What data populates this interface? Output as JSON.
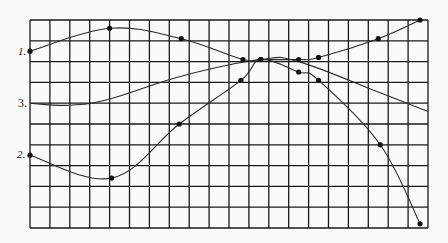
{
  "chart_data": {
    "type": "line",
    "title": "",
    "xlabel": "",
    "ylabel": "",
    "grid": true,
    "xlim": [
      0,
      20
    ],
    "ylim": [
      0,
      10
    ],
    "grid_columns": 20,
    "grid_rows": 10,
    "legend_position": "left-inline",
    "colors": {
      "line": "#2a2a2a",
      "grid": "#1a1a1a",
      "background": "#fafafa"
    },
    "series": [
      {
        "name": "1.",
        "label": "1.",
        "points": [
          [
            0,
            8.5
          ],
          [
            4.0,
            9.6
          ],
          [
            7.6,
            9.1
          ],
          [
            10.7,
            8.1
          ],
          [
            11.6,
            8.1
          ],
          [
            13.5,
            8.1
          ],
          [
            14.5,
            8.2
          ],
          [
            17.5,
            9.1
          ],
          [
            19.6,
            10.0
          ]
        ],
        "markers": [
          [
            0,
            8.5
          ],
          [
            4.0,
            9.6
          ],
          [
            7.6,
            9.1
          ],
          [
            10.7,
            8.1
          ],
          [
            11.6,
            8.1
          ],
          [
            13.5,
            8.1
          ],
          [
            14.5,
            8.2
          ],
          [
            17.5,
            9.1
          ],
          [
            19.6,
            10.0
          ]
        ]
      },
      {
        "name": "2.",
        "label": "2.",
        "points": [
          [
            0,
            3.5
          ],
          [
            4.1,
            2.4
          ],
          [
            7.5,
            5.0
          ],
          [
            10.6,
            7.1
          ],
          [
            11.6,
            8.1
          ],
          [
            13.5,
            7.5
          ],
          [
            14.5,
            7.1
          ],
          [
            17.6,
            4.0
          ],
          [
            19.6,
            0.2
          ]
        ],
        "markers": [
          [
            0,
            3.5
          ],
          [
            4.1,
            2.4
          ],
          [
            7.5,
            5.0
          ],
          [
            10.6,
            7.1
          ],
          [
            11.6,
            8.1
          ],
          [
            13.5,
            7.5
          ],
          [
            14.5,
            7.1
          ],
          [
            17.6,
            4.0
          ],
          [
            19.6,
            0.2
          ]
        ]
      },
      {
        "name": "3.",
        "label": "3.",
        "points": [
          [
            0,
            6.0
          ],
          [
            2.0,
            5.9
          ],
          [
            4.0,
            6.2
          ],
          [
            7.6,
            7.3
          ],
          [
            11.6,
            8.1
          ],
          [
            13.5,
            8.0
          ],
          [
            17.6,
            6.5
          ],
          [
            20.0,
            5.6
          ]
        ],
        "markers": []
      }
    ]
  }
}
